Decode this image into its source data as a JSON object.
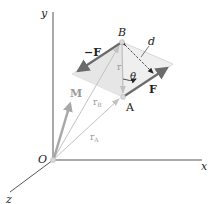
{
  "figure": {
    "colors": {
      "axis": "#555555",
      "force_arrow": "#6b6b6b",
      "position_vector": "#c2c2c2",
      "moment_arrow": "#a8a8a8",
      "plane": "#eeeeee",
      "text": "#222222"
    },
    "axes": {
      "x_label": "x",
      "y_label": "y",
      "z_label": "z",
      "origin_label": "O"
    },
    "points": {
      "A_label": "A",
      "B_label": "B"
    },
    "vectors": {
      "force_label": "F",
      "neg_force_label": "−F",
      "moment_label": "M",
      "r_label": "r",
      "rA_main": "r",
      "rA_sub": "A",
      "rB_main": "r",
      "rB_sub": "B"
    },
    "dimensions": {
      "distance_label": "d",
      "angle_label": "θ"
    }
  }
}
